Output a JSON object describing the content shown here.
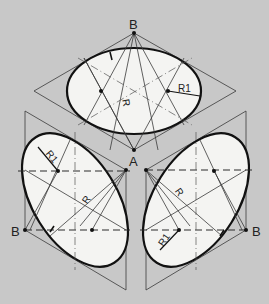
{
  "diagram": {
    "background_color": "#c8c8c8",
    "ellipse_fill": "#f4f4f2",
    "line_color": "#111111",
    "labels": {
      "top_vertex": "B",
      "center_vertex": "A",
      "left_vertex": "B",
      "right_vertex": "B",
      "top_radius_large": "R",
      "top_radius_small": "R1",
      "left_radius_large": "R",
      "left_radius_small": "R1",
      "right_radius_large": "R",
      "right_radius_small": "R1"
    },
    "faces": [
      {
        "name": "top",
        "rhombus": [
          [
            134,
            33
          ],
          [
            236,
            91
          ],
          [
            134,
            150
          ],
          [
            34,
            91
          ]
        ],
        "ellipse": {
          "cx": 134,
          "cy": 91,
          "rx": 67,
          "ry": 43,
          "rotate": 0
        }
      },
      {
        "name": "left",
        "rhombus": [
          [
            25,
            111
          ],
          [
            126,
            170
          ],
          [
            126,
            290
          ],
          [
            25,
            230
          ]
        ],
        "ellipse": {
          "cx": 75,
          "cy": 200,
          "rx": 72,
          "ry": 40,
          "rotate": 58
        }
      },
      {
        "name": "right",
        "rhombus": [
          [
            246,
            111
          ],
          [
            146,
            170
          ],
          [
            146,
            290
          ],
          [
            246,
            230
          ]
        ],
        "ellipse": {
          "cx": 196,
          "cy": 200,
          "rx": 72,
          "ry": 40,
          "rotate": -58
        }
      }
    ]
  }
}
